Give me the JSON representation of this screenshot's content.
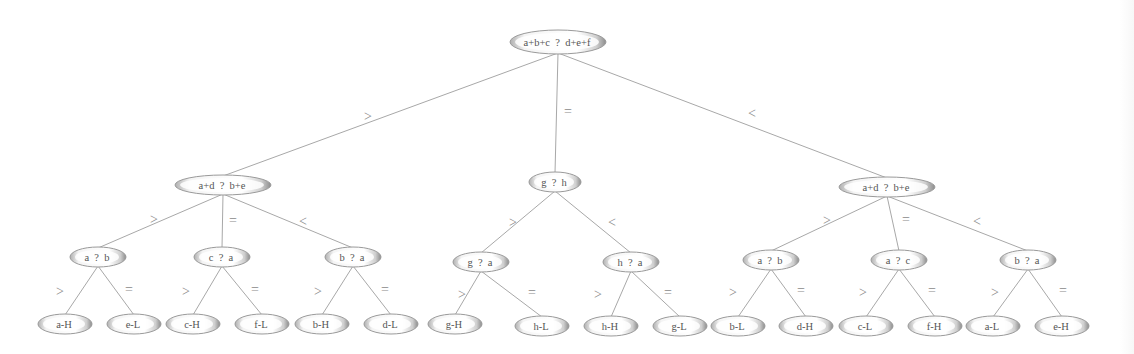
{
  "diagram": {
    "title": "",
    "type": "decision-tree",
    "colors": {
      "edge": "#a8a8a8",
      "edge_label": "#8a8a8a",
      "node_fill_light": "#ffffff",
      "node_fill_dark": "#b4b4b4",
      "node_stroke": "#9a9a9a",
      "node_text": "#555555"
    },
    "nodes": [
      {
        "id": "root",
        "label": "a+b+c  ?  d+e+f",
        "level": 1,
        "cx": 558,
        "cy": 42,
        "rx": 48,
        "ry": 12
      },
      {
        "id": "L",
        "label": "a+d  ?  b+e",
        "level": 2,
        "cx": 223,
        "cy": 185,
        "rx": 48,
        "ry": 10
      },
      {
        "id": "M",
        "label": "g  ?  h",
        "level": 2,
        "cx": 555,
        "cy": 182,
        "rx": 26,
        "ry": 10
      },
      {
        "id": "R",
        "label": "a+d  ?  b+e",
        "level": 2,
        "cx": 887,
        "cy": 187,
        "rx": 48,
        "ry": 10
      },
      {
        "id": "L1",
        "label": "a  ?  b",
        "level": 3,
        "cx": 98,
        "cy": 257,
        "rx": 28,
        "ry": 10
      },
      {
        "id": "L2",
        "label": "c  ?  a",
        "level": 3,
        "cx": 222,
        "cy": 257,
        "rx": 28,
        "ry": 10
      },
      {
        "id": "L3",
        "label": "b  ?  a",
        "level": 3,
        "cx": 353,
        "cy": 257,
        "rx": 28,
        "ry": 10
      },
      {
        "id": "M1",
        "label": "g  ?  a",
        "level": 3,
        "cx": 481,
        "cy": 262,
        "rx": 28,
        "ry": 10
      },
      {
        "id": "M2",
        "label": "h  ?  a",
        "level": 3,
        "cx": 631,
        "cy": 262,
        "rx": 28,
        "ry": 10
      },
      {
        "id": "R1",
        "label": "a  ?  b",
        "level": 3,
        "cx": 771,
        "cy": 260,
        "rx": 28,
        "ry": 10
      },
      {
        "id": "R2",
        "label": "a  ?  c",
        "level": 3,
        "cx": 899,
        "cy": 260,
        "rx": 28,
        "ry": 10
      },
      {
        "id": "R3",
        "label": "b  ?  a",
        "level": 3,
        "cx": 1028,
        "cy": 260,
        "rx": 28,
        "ry": 10
      },
      {
        "id": "L1a",
        "label": "a-H",
        "level": 4,
        "cx": 65,
        "cy": 324,
        "rx": 27,
        "ry": 10
      },
      {
        "id": "L1b",
        "label": "e-L",
        "level": 4,
        "cx": 134,
        "cy": 324,
        "rx": 27,
        "ry": 10
      },
      {
        "id": "L2a",
        "label": "c-H",
        "level": 4,
        "cx": 193,
        "cy": 324,
        "rx": 27,
        "ry": 10
      },
      {
        "id": "L2b",
        "label": "f-L",
        "level": 4,
        "cx": 262,
        "cy": 324,
        "rx": 27,
        "ry": 10
      },
      {
        "id": "L3a",
        "label": "b-H",
        "level": 4,
        "cx": 322,
        "cy": 324,
        "rx": 27,
        "ry": 10
      },
      {
        "id": "L3b",
        "label": "d-L",
        "level": 4,
        "cx": 391,
        "cy": 324,
        "rx": 27,
        "ry": 10
      },
      {
        "id": "M1a",
        "label": "g-H",
        "level": 4,
        "cx": 455,
        "cy": 324,
        "rx": 27,
        "ry": 10
      },
      {
        "id": "M1b",
        "label": "h-L",
        "level": 4,
        "cx": 542,
        "cy": 326,
        "rx": 27,
        "ry": 10
      },
      {
        "id": "M2a",
        "label": "h-H",
        "level": 4,
        "cx": 611,
        "cy": 326,
        "rx": 27,
        "ry": 10
      },
      {
        "id": "M2b",
        "label": "g-L",
        "level": 4,
        "cx": 680,
        "cy": 326,
        "rx": 27,
        "ry": 10
      },
      {
        "id": "R1a",
        "label": "b-L",
        "level": 4,
        "cx": 738,
        "cy": 326,
        "rx": 27,
        "ry": 10
      },
      {
        "id": "R1b",
        "label": "d-H",
        "level": 4,
        "cx": 806,
        "cy": 326,
        "rx": 27,
        "ry": 10
      },
      {
        "id": "R2a",
        "label": "c-L",
        "level": 4,
        "cx": 866,
        "cy": 326,
        "rx": 27,
        "ry": 10
      },
      {
        "id": "R2b",
        "label": "f-H",
        "level": 4,
        "cx": 935,
        "cy": 326,
        "rx": 27,
        "ry": 10
      },
      {
        "id": "R3a",
        "label": "a-L",
        "level": 4,
        "cx": 993,
        "cy": 326,
        "rx": 27,
        "ry": 10
      },
      {
        "id": "R3b",
        "label": "e-H",
        "level": 4,
        "cx": 1062,
        "cy": 326,
        "rx": 27,
        "ry": 10
      }
    ],
    "edges": [
      {
        "from": "root",
        "to": "L",
        "label": ">",
        "lx": 368,
        "ly": 116
      },
      {
        "from": "root",
        "to": "M",
        "label": "=",
        "lx": 568,
        "ly": 111
      },
      {
        "from": "root",
        "to": "R",
        "label": "<",
        "lx": 752,
        "ly": 113
      },
      {
        "from": "L",
        "to": "L1",
        "label": ">",
        "lx": 154,
        "ly": 219
      },
      {
        "from": "L",
        "to": "L2",
        "label": "=",
        "lx": 233,
        "ly": 220
      },
      {
        "from": "L",
        "to": "L3",
        "label": "<",
        "lx": 303,
        "ly": 221
      },
      {
        "from": "M",
        "to": "M1",
        "label": ">",
        "lx": 513,
        "ly": 222
      },
      {
        "from": "M",
        "to": "M2",
        "label": "<",
        "lx": 612,
        "ly": 222
      },
      {
        "from": "R",
        "to": "R1",
        "label": ">",
        "lx": 827,
        "ly": 220
      },
      {
        "from": "R",
        "to": "R2",
        "label": "=",
        "lx": 906,
        "ly": 219
      },
      {
        "from": "R",
        "to": "R3",
        "label": "<",
        "lx": 977,
        "ly": 221
      },
      {
        "from": "L1",
        "to": "L1a",
        "label": ">",
        "lx": 60,
        "ly": 291
      },
      {
        "from": "L1",
        "to": "L1b",
        "label": "=",
        "lx": 129,
        "ly": 289
      },
      {
        "from": "L2",
        "to": "L2a",
        "label": ">",
        "lx": 186,
        "ly": 291
      },
      {
        "from": "L2",
        "to": "L2b",
        "label": "=",
        "lx": 255,
        "ly": 289
      },
      {
        "from": "L3",
        "to": "L3a",
        "label": ">",
        "lx": 318,
        "ly": 291
      },
      {
        "from": "L3",
        "to": "L3b",
        "label": "=",
        "lx": 385,
        "ly": 289
      },
      {
        "from": "M1",
        "to": "M1a",
        "label": ">",
        "lx": 462,
        "ly": 294
      },
      {
        "from": "M1",
        "to": "M1b",
        "label": "=",
        "lx": 532,
        "ly": 292
      },
      {
        "from": "M2",
        "to": "M2a",
        "label": ">",
        "lx": 598,
        "ly": 294
      },
      {
        "from": "M2",
        "to": "M2b",
        "label": "=",
        "lx": 668,
        "ly": 292
      },
      {
        "from": "R1",
        "to": "R1a",
        "label": ">",
        "lx": 733,
        "ly": 292
      },
      {
        "from": "R1",
        "to": "R1b",
        "label": "=",
        "lx": 801,
        "ly": 290
      },
      {
        "from": "R2",
        "to": "R2a",
        "label": ">",
        "lx": 863,
        "ly": 292
      },
      {
        "from": "R2",
        "to": "R2b",
        "label": "=",
        "lx": 932,
        "ly": 290
      },
      {
        "from": "R3",
        "to": "R3a",
        "label": ">",
        "lx": 995,
        "ly": 292
      },
      {
        "from": "R3",
        "to": "R3b",
        "label": "=",
        "lx": 1063,
        "ly": 290
      }
    ]
  }
}
